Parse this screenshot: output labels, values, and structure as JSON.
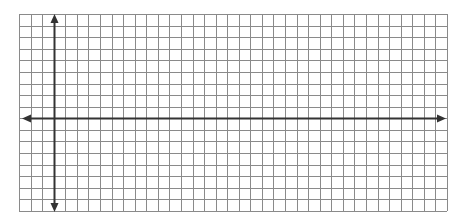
{
  "chart_data": {
    "type": "grid",
    "title": "",
    "grid": {
      "columns": 37,
      "rows": 17,
      "y_axis_column": 3,
      "x_axis_row": 9
    },
    "axes": {
      "x_axis": {
        "arrows": [
          "left",
          "right"
        ],
        "label": "",
        "ticks": []
      },
      "y_axis": {
        "arrows": [
          "up",
          "down"
        ],
        "label": "",
        "ticks": []
      }
    },
    "colors": {
      "grid_line": "#8a8a8a",
      "axis": "#333333",
      "background": "#ffffff"
    }
  }
}
